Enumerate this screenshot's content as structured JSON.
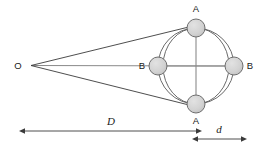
{
  "figure": {
    "background_color": "#ffffff",
    "labels": {
      "observer": "O",
      "top_sphere": "A",
      "bottom_sphere": "A",
      "left_sphere": "B",
      "right_sphere": "B",
      "distance_major": "D",
      "distance_minor": "d"
    },
    "colors": {
      "sphere_fill": "#d2d2d2",
      "sphere_stroke": "#6e6e6e",
      "line": "#3a3a3a",
      "orbit_stroke": "#5a5a5a",
      "axis_line": "#8a8a8a",
      "text": "#1a1a1a"
    },
    "geometry": {
      "observer_point": {
        "x": 31,
        "y": 65
      },
      "orbit_center": {
        "x": 196,
        "y": 66
      },
      "orbit_radius": 38,
      "inner_ellipse_rx": 33,
      "inner_ellipse_ry": 38,
      "sphere_radius": 9,
      "spheres": [
        {
          "name": "A",
          "label_position": "above",
          "x": 196,
          "y": 28
        },
        {
          "name": "A",
          "label_position": "below",
          "x": 196,
          "y": 104
        },
        {
          "name": "B",
          "label_position": "left",
          "x": 158,
          "y": 66
        },
        {
          "name": "B",
          "label_position": "right",
          "x": 234,
          "y": 66
        }
      ]
    },
    "dimensions": [
      {
        "id": "D",
        "label": "D",
        "label_x": 111,
        "label_y": 124,
        "line_y": 131,
        "x_start": 25,
        "x_end": 196,
        "arrow_start": true,
        "arrow_end": true
      },
      {
        "id": "d",
        "label": "d",
        "label_x": 219,
        "label_y": 132,
        "line_y": 139,
        "x_start": 197,
        "x_end": 241,
        "arrow_start": true,
        "arrow_end": true
      }
    ]
  }
}
